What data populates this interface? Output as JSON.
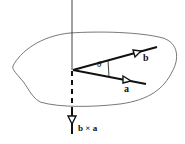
{
  "diagram": {
    "title": "",
    "labels": {
      "vector_b": "b",
      "vector_a": "a",
      "angle": "θ",
      "cross_product": "b × a"
    },
    "colors": {
      "stroke": "#111111",
      "outline": "#555555",
      "background": "#ffffff"
    }
  }
}
